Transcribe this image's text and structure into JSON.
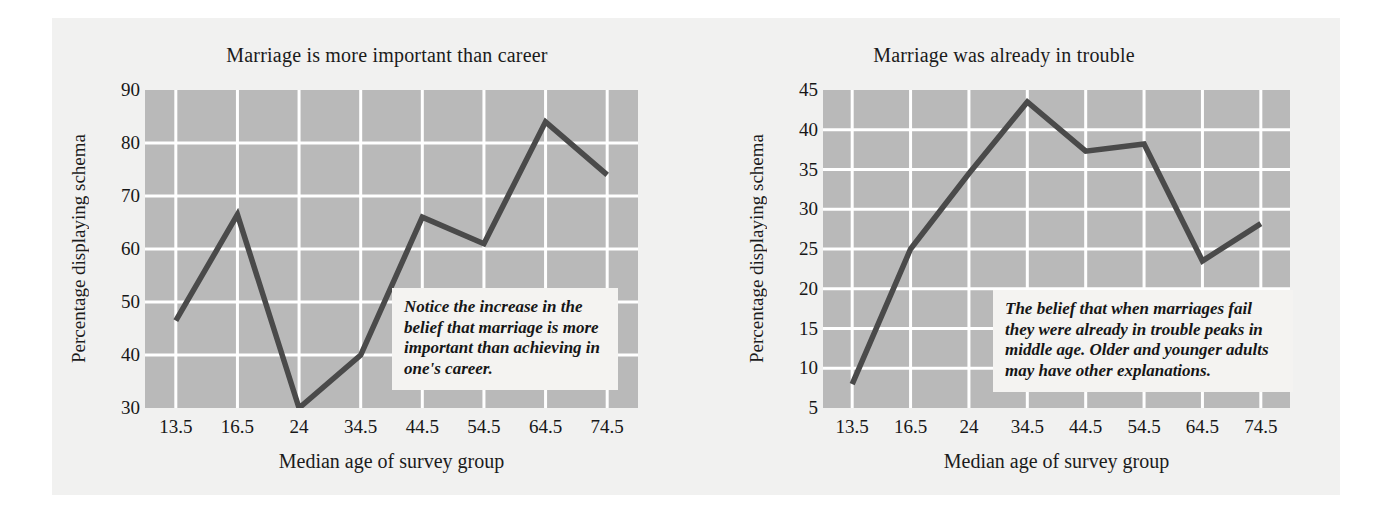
{
  "figure": {
    "background_color": "#f1f1f0",
    "plot_background_color": "#b9b9b9",
    "gridline_color": "#ffffff",
    "line_color": "#4a4a4a"
  },
  "chart_data": [
    {
      "type": "line",
      "id": "marriage-more-important-than-career",
      "title": "Marriage is more important than career",
      "xlabel": "Median age of survey group",
      "ylabel": "Percentage displaying schema",
      "categories": [
        "13.5",
        "16.5",
        "24",
        "34.5",
        "44.5",
        "54.5",
        "64.5",
        "74.5"
      ],
      "xticklabels": [
        "13.5",
        "16.5",
        "24",
        "34.5",
        "44.5",
        "54.5",
        "64.5",
        "74.5"
      ],
      "yticklabels": [
        "30",
        "40",
        "50",
        "60",
        "70",
        "80",
        "90"
      ],
      "yticks": [
        30,
        40,
        50,
        60,
        70,
        80,
        90
      ],
      "values": [
        46.5,
        66.5,
        30,
        40,
        66,
        61,
        84,
        74
      ],
      "ylim": [
        30,
        90
      ],
      "grid": true,
      "legend": "none",
      "annotation": "Notice the increase in the belief that marriage is more important than achieving in one's career."
    },
    {
      "type": "line",
      "id": "marriage-already-in-trouble",
      "title": "Marriage was already in trouble",
      "xlabel": "Median age of survey group",
      "ylabel": "Percentage displaying schema",
      "categories": [
        "13.5",
        "16.5",
        "24",
        "34.5",
        "44.5",
        "54.5",
        "64.5",
        "74.5"
      ],
      "xticklabels": [
        "13.5",
        "16.5",
        "24",
        "34.5",
        "44.5",
        "54.5",
        "64.5",
        "74.5"
      ],
      "yticklabels": [
        "5",
        "10",
        "15",
        "20",
        "25",
        "30",
        "35",
        "40",
        "45"
      ],
      "yticks": [
        5,
        10,
        15,
        20,
        25,
        30,
        35,
        40,
        45
      ],
      "values": [
        8,
        25,
        34.5,
        43.5,
        37.3,
        38.2,
        23.5,
        28.2
      ],
      "ylim": [
        5,
        45
      ],
      "grid": true,
      "legend": "none",
      "annotation": "The belief that when marriages fail they were already in trouble peaks in middle age. Older and younger adults may have other explanations."
    }
  ]
}
